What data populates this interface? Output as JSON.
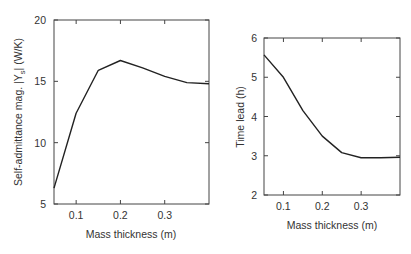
{
  "chart_data": [
    {
      "type": "line",
      "title": "",
      "xlabel": "Mass thickness (m)",
      "ylabel": "Self-admittance mag. |Ys| (W/K)",
      "ylabel_parts": {
        "pre": "Self-admittance mag. |Y",
        "sub": "s",
        "post": "| (W/K)"
      },
      "xlim": [
        0.05,
        0.4
      ],
      "ylim": [
        5,
        20
      ],
      "xticks": [
        0.1,
        0.2,
        0.3
      ],
      "xtick_labels": [
        "0.1",
        "0.2",
        "0.3"
      ],
      "yticks": [
        5,
        10,
        15,
        20
      ],
      "ytick_labels": [
        "5",
        "10",
        "15",
        "20"
      ],
      "grid": false,
      "legend": null,
      "series": [
        {
          "name": "Self-admittance magnitude",
          "x": [
            0.05,
            0.1,
            0.15,
            0.2,
            0.25,
            0.3,
            0.35,
            0.4
          ],
          "y": [
            6.3,
            12.4,
            15.9,
            16.7,
            16.1,
            15.4,
            14.9,
            14.8
          ]
        }
      ]
    },
    {
      "type": "line",
      "title": "",
      "xlabel": "Mass thickness (m)",
      "ylabel": "Time lead (h)",
      "xlim": [
        0.05,
        0.4
      ],
      "ylim": [
        2,
        6
      ],
      "xticks": [
        0.1,
        0.2,
        0.3
      ],
      "xtick_labels": [
        "0.1",
        "0.2",
        "0.3"
      ],
      "yticks": [
        2,
        3,
        4,
        5,
        6
      ],
      "ytick_labels": [
        "2",
        "3",
        "4",
        "5",
        "6"
      ],
      "grid": false,
      "legend": null,
      "series": [
        {
          "name": "Time lead",
          "x": [
            0.05,
            0.1,
            0.15,
            0.2,
            0.25,
            0.3,
            0.35,
            0.4
          ],
          "y": [
            5.57,
            5.0,
            4.15,
            3.5,
            3.08,
            2.95,
            2.95,
            2.96
          ]
        }
      ]
    }
  ]
}
